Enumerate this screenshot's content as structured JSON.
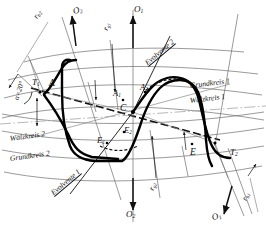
{
  "figure": {
    "language": "de",
    "background_color": "#ffffff",
    "line_color": "#101010",
    "thin_line_color": "#6a6a6a",
    "profile_color": "#000000"
  },
  "curve_labels": {
    "evolvente_2": "Evolvente 2",
    "evolvente_1": "Evolvente 1",
    "grundkreis_1": "Grundkreis 1",
    "waelzkreis_1": "Wälzkreis 1",
    "waelzkreis_2": "Wälzkreis 2",
    "grundkreis_2": "Grundkreis 2"
  },
  "points": {
    "t1": "T",
    "t1_sub": "1",
    "a": "A",
    "a1": "A",
    "a1_sub": "1",
    "a2": "A",
    "a2_sub": "2",
    "c": "C",
    "e1": "E",
    "e1_sub": "1",
    "e2": "E",
    "e2_sub": "2",
    "e": "E",
    "t2": "T",
    "t2_sub": "2"
  },
  "axis_arrows": [
    {
      "id": "o2-top-left",
      "label": "O",
      "sub": "2",
      "direction": "up"
    },
    {
      "id": "o1-top",
      "label": "O",
      "sub": "1",
      "direction": "up"
    },
    {
      "id": "o2-bottom",
      "label": "O",
      "sub": "2",
      "direction": "down"
    },
    {
      "id": "o1-bottom",
      "label": "O",
      "sub": "1",
      "direction": "down"
    }
  ],
  "dimensions": [
    {
      "id": "rb2-topleft",
      "label": "r",
      "sub": "b2"
    },
    {
      "id": "rg1-top",
      "label": "r",
      "sub": "g1"
    },
    {
      "id": "rg2-bottom",
      "label": "r",
      "sub": "g2"
    },
    {
      "id": "rb1-bottomright",
      "label": "r",
      "sub": "b1"
    }
  ],
  "angle": {
    "text": "α",
    "eq": "=20°",
    "full": "α=20°"
  }
}
